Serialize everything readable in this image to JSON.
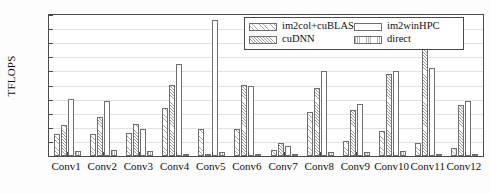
{
  "chart_data": {
    "type": "bar",
    "title": "",
    "xlabel": "",
    "ylabel": "TFLOPS",
    "ylim": [
      0,
      20
    ],
    "yticks": [
      0,
      2,
      4,
      6,
      8,
      10,
      12,
      14,
      16,
      18,
      20
    ],
    "grid": true,
    "legend_position": "top-right",
    "categories": [
      "Conv1",
      "Conv2",
      "Conv3",
      "Conv4",
      "Conv5",
      "Conv6",
      "Conv7",
      "Conv8",
      "Conv9",
      "Conv10",
      "Conv11",
      "Conv12"
    ],
    "series": [
      {
        "name": "im2col+cuBLAS",
        "values": [
          3.1,
          3.1,
          3.2,
          6.85,
          3.85,
          3.9,
          0.9,
          6.3,
          2.2,
          3.5,
          1.9,
          1.1
        ]
      },
      {
        "name": "cuDNN",
        "values": [
          4.45,
          5.55,
          4.6,
          10.05,
          0.2,
          10.1,
          1.8,
          9.6,
          6.5,
          11.7,
          15.7,
          7.2
        ]
      },
      {
        "name": "im2winHPC",
        "values": [
          8.05,
          7.75,
          3.8,
          13.05,
          19.3,
          10.0,
          1.45,
          12.1,
          7.4,
          12.1,
          12.5,
          7.85
        ]
      },
      {
        "name": "direct",
        "values": [
          0.7,
          0.8,
          0.7,
          0.3,
          0.6,
          0.15,
          0.35,
          0.6,
          0.6,
          0.7,
          0.25,
          0.05
        ]
      }
    ]
  },
  "legend": {
    "entries": [
      {
        "label": "im2col+cuBLAS",
        "pattern": "diagonal-hatch"
      },
      {
        "label": "im2winHPC",
        "pattern": "solid-white"
      },
      {
        "label": "cuDNN",
        "pattern": "diagonal-hatch-dense"
      },
      {
        "label": "direct",
        "pattern": "vertical-hatch"
      }
    ]
  },
  "colors": {
    "axis": "#4a4a4a",
    "grid": "#e2e2e2",
    "bar_edge": "#6f6f6f",
    "background": "#ffffff"
  }
}
